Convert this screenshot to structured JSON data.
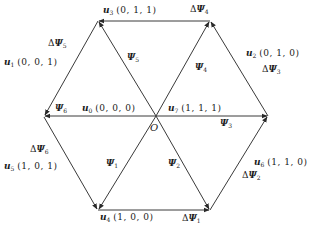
{
  "diagram": {
    "title": "",
    "colors": {
      "line": "#3a3a3a",
      "text": "#1a1a1a",
      "background": "#ffffff"
    },
    "origin_label": "O",
    "vertices": [
      {
        "id": "top-left",
        "x": 98,
        "y": 21
      },
      {
        "id": "top-right",
        "x": 210,
        "y": 21
      },
      {
        "id": "right",
        "x": 268,
        "y": 116
      },
      {
        "id": "bottom-right",
        "x": 210,
        "y": 210
      },
      {
        "id": "bottom-left",
        "x": 98,
        "y": 210
      },
      {
        "id": "left",
        "x": 44,
        "y": 116
      }
    ],
    "voltage_vectors": [
      {
        "name": "u",
        "sub": "0",
        "coords": "(0, 0, 0)"
      },
      {
        "name": "u",
        "sub": "1",
        "coords": "(0, 0, 1)"
      },
      {
        "name": "u",
        "sub": "2",
        "coords": "(0, 1, 0)"
      },
      {
        "name": "u",
        "sub": "3",
        "coords": "(0, 1, 1)"
      },
      {
        "name": "u",
        "sub": "4",
        "coords": "(1, 0, 0)"
      },
      {
        "name": "u",
        "sub": "5",
        "coords": "(1, 0, 1)"
      },
      {
        "name": "u",
        "sub": "6",
        "coords": "(1, 1, 0)"
      },
      {
        "name": "u",
        "sub": "7",
        "coords": "(1, 1, 1)"
      }
    ],
    "flux_vectors": [
      {
        "name": "Ψ",
        "sub": "1"
      },
      {
        "name": "Ψ",
        "sub": "2"
      },
      {
        "name": "Ψ",
        "sub": "3"
      },
      {
        "name": "Ψ",
        "sub": "4"
      },
      {
        "name": "Ψ",
        "sub": "5"
      },
      {
        "name": "Ψ",
        "sub": "6"
      }
    ],
    "flux_increments": [
      {
        "prefix": "Δ",
        "name": "Ψ",
        "sub": "1"
      },
      {
        "prefix": "Δ",
        "name": "Ψ",
        "sub": "2"
      },
      {
        "prefix": "Δ",
        "name": "Ψ",
        "sub": "3"
      },
      {
        "prefix": "Δ",
        "name": "Ψ",
        "sub": "4"
      },
      {
        "prefix": "Δ",
        "name": "Ψ",
        "sub": "5"
      },
      {
        "prefix": "Δ",
        "name": "Ψ",
        "sub": "6"
      }
    ]
  }
}
